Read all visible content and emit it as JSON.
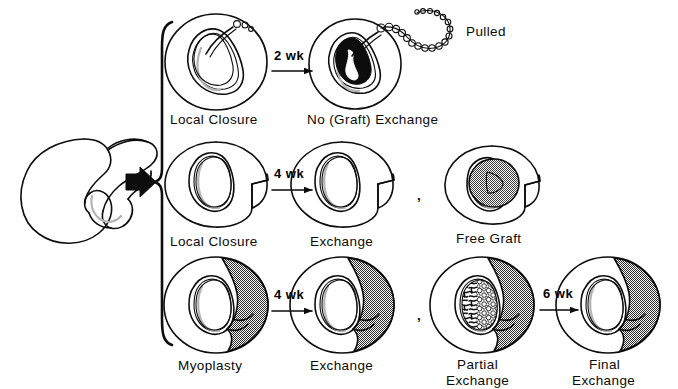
{
  "figure": {
    "background_color": "#ffffff",
    "ink_color": "#0d0d0d",
    "shade_gray": "#8a8a8a",
    "shadow_gray": "#c8c8c8",
    "width": 678,
    "height": 389
  },
  "source": {
    "name": "defect-cross-section",
    "caption": ""
  },
  "brace": {
    "name": "grouping-brace"
  },
  "entry_arrow": {
    "name": "entry-arrow"
  },
  "rows": [
    {
      "id": "row-1",
      "panels": [
        {
          "id": "p1",
          "label": "Local Closure",
          "fill": "dots",
          "name": "panel-local-closure-row1"
        },
        {
          "id": "p2",
          "label": "No (Graft) Exchange",
          "fill": "black",
          "name": "panel-no-graft-exchange"
        }
      ],
      "arrow": {
        "label": "2 wk",
        "name": "arrow-2wk"
      },
      "annotation": {
        "label": "Pulled",
        "name": "pulled-label"
      },
      "separators": []
    },
    {
      "id": "row-2",
      "panels": [
        {
          "id": "p3",
          "label": "Local Closure",
          "fill": "bubbles",
          "name": "panel-local-closure-row2"
        },
        {
          "id": "p4",
          "label": "Exchange",
          "fill": "squiggles",
          "name": "panel-exchange-row2"
        },
        {
          "id": "p5",
          "label": "Free Graft",
          "fill": "graygraft",
          "name": "panel-free-graft"
        }
      ],
      "arrow": {
        "label": "4 wk",
        "name": "arrow-4wk-row2"
      },
      "separators": [
        {
          "label": ",",
          "name": "comma-separator-row2"
        }
      ]
    },
    {
      "id": "row-3",
      "panels": [
        {
          "id": "p6",
          "label": "Myoplasty",
          "fill": "bubbles",
          "flap": true,
          "name": "panel-myoplasty"
        },
        {
          "id": "p7",
          "label": "Exchange",
          "fill": "squiggles",
          "flap": true,
          "name": "panel-exchange-row3"
        },
        {
          "id": "p8",
          "label": "Partial Exchange",
          "label_line1": "Partial",
          "label_line2": "Exchange",
          "fill": "mixed",
          "flap": true,
          "name": "panel-partial-exchange"
        },
        {
          "id": "p9",
          "label": "Final Exchange",
          "label_line1": "Final",
          "label_line2": "Exchange",
          "fill": "squiggles",
          "flap": true,
          "name": "panel-final-exchange"
        }
      ],
      "arrows": [
        {
          "label": "4 wk",
          "name": "arrow-4wk-row3"
        },
        {
          "label": "6 wk",
          "name": "arrow-6wk-row3"
        }
      ],
      "separators": [
        {
          "label": ",",
          "name": "comma-separator-row3"
        }
      ]
    }
  ],
  "labels": {
    "local_closure": "Local Closure",
    "no_graft_exchange": "No (Graft) Exchange",
    "pulled": "Pulled",
    "exchange": "Exchange",
    "free_graft": "Free Graft",
    "myoplasty": "Myoplasty",
    "partial": "Partial",
    "final": "Final",
    "wk2": "2 wk",
    "wk4": "4 wk",
    "wk6": "6 wk",
    "comma": ","
  }
}
